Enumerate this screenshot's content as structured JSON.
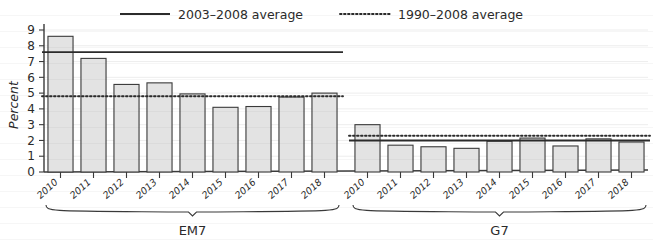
{
  "chart_data": {
    "type": "bar",
    "title": "",
    "subtitle": "",
    "xlabel": "",
    "ylabel": "Percent",
    "ylim": [
      0,
      9
    ],
    "ytick_labels": [
      "0",
      "1",
      "2",
      "3",
      "4",
      "5",
      "6",
      "7",
      "8",
      "9"
    ],
    "grid": true,
    "legend_position": "top",
    "legend": [
      {
        "label": "2003–2008 average",
        "style": "solid-line",
        "color": "#2b2b2b"
      },
      {
        "label": "1990–2008 average",
        "style": "dotted-line",
        "color": "#2b2b2b"
      }
    ],
    "panels": [
      {
        "name": "EM7",
        "categories": [
          "2010",
          "2011",
          "2012",
          "2013",
          "2014",
          "2015",
          "2016",
          "2017",
          "2018"
        ],
        "values": [
          8.6,
          7.2,
          5.55,
          5.65,
          4.95,
          4.1,
          4.15,
          4.75,
          5.0
        ],
        "reference_lines": [
          {
            "label": "2003–2008 average",
            "value": 7.6,
            "style": "solid-line"
          },
          {
            "label": "1990–2008 average",
            "value": 4.8,
            "style": "dotted-line"
          }
        ]
      },
      {
        "name": "G7",
        "categories": [
          "2010",
          "2011",
          "2012",
          "2013",
          "2014",
          "2015",
          "2016",
          "2017",
          "2018"
        ],
        "values": [
          3.0,
          1.7,
          1.6,
          1.5,
          1.95,
          2.15,
          1.65,
          2.1,
          1.9
        ],
        "reference_lines": [
          {
            "label": "2003–2008 average",
            "value": 2.0,
            "style": "solid-line"
          },
          {
            "label": "1990–2008 average",
            "value": 2.3,
            "style": "dotted-line"
          }
        ]
      }
    ],
    "bar_fill": "#e3e3e3",
    "bar_stroke": "#3a3a3a"
  },
  "axis": {
    "y_title": "Percent"
  },
  "legend": {
    "item0": "2003–2008 average",
    "item1": "1990–2008 average"
  },
  "groups": {
    "em7": "EM7",
    "g7": "G7"
  }
}
